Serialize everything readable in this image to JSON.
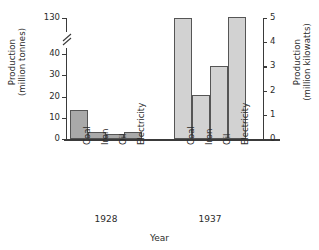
{
  "chart_data": {
    "type": "bar",
    "title": "",
    "xlabel": "Year",
    "ylabel_left": "Production\n(million tonnes)",
    "ylabel_right": "Production\n(million kilowatts)",
    "categories": [
      "Coal",
      "Iron",
      "Oil",
      "Electricity"
    ],
    "groups": [
      "1928",
      "1937"
    ],
    "left_axis": {
      "label": "Production (million tonnes)",
      "ticks": [
        "0",
        "10",
        "20",
        "30",
        "40",
        "130"
      ],
      "tick_values": [
        0,
        10,
        20,
        30,
        40,
        130
      ],
      "ylim": [
        0,
        130
      ],
      "broken": true,
      "break_between": [
        40,
        130
      ]
    },
    "right_axis": {
      "label": "Production (million kilowatts)",
      "ticks": [
        "0",
        "1",
        "2",
        "3",
        "4",
        "5"
      ],
      "tick_values": [
        0,
        1,
        2,
        3,
        4,
        5
      ],
      "ylim": [
        0,
        5
      ]
    },
    "grid": false,
    "legend": "none",
    "series": [
      {
        "name": "1928",
        "color": "#a9a9a9",
        "values": [
          37,
          3.2,
          1.8,
          3.2
        ],
        "units": [
          "million tonnes",
          "million tonnes",
          "million tonnes",
          "million kilowatts"
        ]
      },
      {
        "name": "1937",
        "color": "#d2d2d2",
        "values": [
          130,
          14.8,
          29,
          130
        ],
        "units": [
          "million tonnes",
          "million tonnes",
          "million tonnes",
          "million kilowatts"
        ]
      }
    ]
  },
  "axes": {
    "left_title_line1": "Production",
    "left_title_line2": "(million tonnes)",
    "right_title_line1": "Production",
    "right_title_line2": "(million kilowatts)",
    "x_title": "Year"
  },
  "ticks": {
    "left": [
      "130",
      "40",
      "30",
      "20",
      "10",
      "0"
    ],
    "right": [
      "5",
      "4",
      "3",
      "2",
      "1",
      "0"
    ]
  },
  "bars": [
    {
      "group": "1928",
      "category": "Coal",
      "value": 37,
      "top_px": 28.8
    },
    {
      "group": "1928",
      "category": "Iron",
      "value": 3.2,
      "top_px": 7.3
    },
    {
      "group": "1928",
      "category": "Oil",
      "value": 1.8,
      "top_px": 4.6
    },
    {
      "group": "1928",
      "category": "Electricity",
      "value": 3.2,
      "top_px": 7.3
    },
    {
      "group": "1937",
      "category": "Coal",
      "value": 130,
      "top_px": 121
    },
    {
      "group": "1937",
      "category": "Iron",
      "value": 14.8,
      "top_px": 44.5
    },
    {
      "group": "1937",
      "category": "Oil",
      "value": 29,
      "top_px": 73.5
    },
    {
      "group": "1937",
      "category": "Electricity",
      "value": 130,
      "top_px": 122
    }
  ],
  "group_labels": [
    "1928",
    "1937"
  ],
  "colors": {
    "bar_1928": "#a9a9a9",
    "bar_1937": "#d2d2d2",
    "bar_border": "#555555",
    "axis": "#3a3a3a",
    "text": "#2b2b2b",
    "background": "#ffffff"
  }
}
